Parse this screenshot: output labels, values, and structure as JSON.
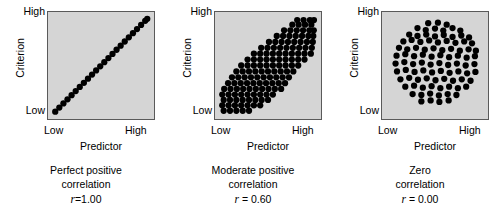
{
  "figure": {
    "background": "#ffffff",
    "plot_background": "#d5d5d5",
    "plot_border": "#5a5a5a",
    "dot_color": "#000000"
  },
  "axes": {
    "x_label": "Predictor",
    "y_label": "Criterion",
    "x_tick_low": "Low",
    "x_tick_high": "High",
    "y_tick_low": "Low",
    "y_tick_high": "High"
  },
  "panels": [
    {
      "id": "perfect-positive",
      "caption_line1": "Perfect positive",
      "caption_line2": "correlation",
      "r_symbol": "r",
      "r_value": "=1.00"
    },
    {
      "id": "moderate-positive",
      "caption_line1": "Moderate positive",
      "caption_line2": "correlation",
      "r_symbol": "r",
      "r_value": "= 0.60"
    },
    {
      "id": "zero",
      "caption_line1": "Zero",
      "caption_line2": "correlation",
      "r_symbol": "r",
      "r_value": "= 0.00"
    }
  ],
  "chart_data": {
    "type": "scatter",
    "title": "",
    "xlabel": "Predictor",
    "ylabel": "Criterion",
    "xlim": [
      0,
      1
    ],
    "ylim": [
      0,
      1
    ],
    "xticks": [
      "Low",
      "High"
    ],
    "yticks": [
      "Low",
      "High"
    ],
    "grid": false,
    "legend": "none",
    "marker": "filled-circle",
    "marker_radius_px": 3.2,
    "series": [
      {
        "name": "Perfect positive correlation",
        "r": 1.0,
        "n": 24,
        "points": [
          [
            0.03,
            0.03
          ],
          [
            0.072,
            0.072
          ],
          [
            0.114,
            0.114
          ],
          [
            0.156,
            0.156
          ],
          [
            0.198,
            0.198
          ],
          [
            0.24,
            0.24
          ],
          [
            0.282,
            0.282
          ],
          [
            0.324,
            0.324
          ],
          [
            0.366,
            0.366
          ],
          [
            0.408,
            0.408
          ],
          [
            0.45,
            0.45
          ],
          [
            0.492,
            0.492
          ],
          [
            0.534,
            0.534
          ],
          [
            0.576,
            0.576
          ],
          [
            0.618,
            0.618
          ],
          [
            0.66,
            0.66
          ],
          [
            0.702,
            0.702
          ],
          [
            0.744,
            0.744
          ],
          [
            0.786,
            0.786
          ],
          [
            0.828,
            0.828
          ],
          [
            0.87,
            0.87
          ],
          [
            0.912,
            0.912
          ],
          [
            0.954,
            0.954
          ],
          [
            0.975,
            0.975
          ]
        ]
      },
      {
        "name": "Moderate positive correlation",
        "r": 0.6,
        "n": 118,
        "points": [
          [
            0.045,
            0.04
          ],
          [
            0.11,
            0.04
          ],
          [
            0.175,
            0.04
          ],
          [
            0.24,
            0.04
          ],
          [
            0.305,
            0.04
          ],
          [
            0.03,
            0.095
          ],
          [
            0.095,
            0.095
          ],
          [
            0.16,
            0.095
          ],
          [
            0.225,
            0.095
          ],
          [
            0.29,
            0.095
          ],
          [
            0.355,
            0.095
          ],
          [
            0.42,
            0.095
          ],
          [
            0.045,
            0.15
          ],
          [
            0.11,
            0.15
          ],
          [
            0.175,
            0.15
          ],
          [
            0.24,
            0.15
          ],
          [
            0.305,
            0.15
          ],
          [
            0.37,
            0.15
          ],
          [
            0.435,
            0.15
          ],
          [
            0.5,
            0.15
          ],
          [
            0.03,
            0.205
          ],
          [
            0.095,
            0.205
          ],
          [
            0.16,
            0.205
          ],
          [
            0.225,
            0.205
          ],
          [
            0.29,
            0.205
          ],
          [
            0.355,
            0.205
          ],
          [
            0.42,
            0.205
          ],
          [
            0.485,
            0.205
          ],
          [
            0.55,
            0.205
          ],
          [
            0.05,
            0.262
          ],
          [
            0.115,
            0.262
          ],
          [
            0.18,
            0.262
          ],
          [
            0.245,
            0.262
          ],
          [
            0.31,
            0.262
          ],
          [
            0.375,
            0.262
          ],
          [
            0.44,
            0.262
          ],
          [
            0.505,
            0.262
          ],
          [
            0.57,
            0.262
          ],
          [
            0.635,
            0.262
          ],
          [
            0.09,
            0.32
          ],
          [
            0.155,
            0.32
          ],
          [
            0.22,
            0.32
          ],
          [
            0.285,
            0.32
          ],
          [
            0.35,
            0.32
          ],
          [
            0.415,
            0.32
          ],
          [
            0.48,
            0.32
          ],
          [
            0.545,
            0.32
          ],
          [
            0.61,
            0.32
          ],
          [
            0.675,
            0.32
          ],
          [
            0.13,
            0.38
          ],
          [
            0.195,
            0.38
          ],
          [
            0.26,
            0.38
          ],
          [
            0.325,
            0.38
          ],
          [
            0.39,
            0.38
          ],
          [
            0.455,
            0.38
          ],
          [
            0.52,
            0.38
          ],
          [
            0.585,
            0.38
          ],
          [
            0.65,
            0.38
          ],
          [
            0.715,
            0.38
          ],
          [
            0.175,
            0.44
          ],
          [
            0.24,
            0.44
          ],
          [
            0.305,
            0.44
          ],
          [
            0.37,
            0.44
          ],
          [
            0.435,
            0.44
          ],
          [
            0.5,
            0.44
          ],
          [
            0.565,
            0.44
          ],
          [
            0.63,
            0.44
          ],
          [
            0.695,
            0.44
          ],
          [
            0.76,
            0.44
          ],
          [
            0.225,
            0.5
          ],
          [
            0.29,
            0.5
          ],
          [
            0.355,
            0.5
          ],
          [
            0.42,
            0.5
          ],
          [
            0.485,
            0.5
          ],
          [
            0.55,
            0.5
          ],
          [
            0.615,
            0.5
          ],
          [
            0.68,
            0.5
          ],
          [
            0.745,
            0.5
          ],
          [
            0.81,
            0.5
          ],
          [
            0.29,
            0.56
          ],
          [
            0.355,
            0.56
          ],
          [
            0.42,
            0.56
          ],
          [
            0.485,
            0.56
          ],
          [
            0.55,
            0.56
          ],
          [
            0.615,
            0.56
          ],
          [
            0.68,
            0.56
          ],
          [
            0.745,
            0.56
          ],
          [
            0.81,
            0.56
          ],
          [
            0.875,
            0.56
          ],
          [
            0.355,
            0.62
          ],
          [
            0.42,
            0.62
          ],
          [
            0.485,
            0.62
          ],
          [
            0.55,
            0.62
          ],
          [
            0.615,
            0.62
          ],
          [
            0.68,
            0.62
          ],
          [
            0.745,
            0.62
          ],
          [
            0.81,
            0.62
          ],
          [
            0.875,
            0.62
          ],
          [
            0.94,
            0.62
          ],
          [
            0.43,
            0.68
          ],
          [
            0.495,
            0.68
          ],
          [
            0.56,
            0.68
          ],
          [
            0.625,
            0.68
          ],
          [
            0.69,
            0.68
          ],
          [
            0.755,
            0.68
          ],
          [
            0.82,
            0.68
          ],
          [
            0.885,
            0.68
          ],
          [
            0.95,
            0.68
          ],
          [
            0.51,
            0.74
          ],
          [
            0.575,
            0.74
          ],
          [
            0.64,
            0.74
          ],
          [
            0.705,
            0.74
          ],
          [
            0.77,
            0.74
          ],
          [
            0.835,
            0.74
          ],
          [
            0.9,
            0.74
          ],
          [
            0.96,
            0.74
          ],
          [
            0.59,
            0.8
          ],
          [
            0.655,
            0.8
          ],
          [
            0.72,
            0.8
          ],
          [
            0.785,
            0.8
          ],
          [
            0.85,
            0.8
          ],
          [
            0.915,
            0.8
          ],
          [
            0.965,
            0.8
          ],
          [
            0.665,
            0.858
          ],
          [
            0.73,
            0.858
          ],
          [
            0.795,
            0.858
          ],
          [
            0.86,
            0.858
          ],
          [
            0.925,
            0.858
          ],
          [
            0.97,
            0.858
          ],
          [
            0.75,
            0.915
          ],
          [
            0.815,
            0.915
          ],
          [
            0.88,
            0.915
          ],
          [
            0.945,
            0.915
          ],
          [
            0.8,
            0.962
          ],
          [
            0.865,
            0.962
          ],
          [
            0.93,
            0.962
          ],
          [
            0.972,
            0.962
          ]
        ]
      },
      {
        "name": "Zero correlation",
        "r": 0.0,
        "n": 92,
        "points": [
          [
            0.43,
            0.93
          ],
          [
            0.53,
            0.935
          ],
          [
            0.62,
            0.915
          ],
          [
            0.32,
            0.88
          ],
          [
            0.405,
            0.86
          ],
          [
            0.5,
            0.875
          ],
          [
            0.585,
            0.855
          ],
          [
            0.68,
            0.88
          ],
          [
            0.76,
            0.855
          ],
          [
            0.235,
            0.815
          ],
          [
            0.32,
            0.8
          ],
          [
            0.41,
            0.815
          ],
          [
            0.5,
            0.795
          ],
          [
            0.59,
            0.81
          ],
          [
            0.68,
            0.79
          ],
          [
            0.77,
            0.805
          ],
          [
            0.85,
            0.785
          ],
          [
            0.175,
            0.745
          ],
          [
            0.26,
            0.76
          ],
          [
            0.35,
            0.74
          ],
          [
            0.44,
            0.755
          ],
          [
            0.53,
            0.735
          ],
          [
            0.62,
            0.75
          ],
          [
            0.71,
            0.73
          ],
          [
            0.8,
            0.745
          ],
          [
            0.88,
            0.725
          ],
          [
            0.13,
            0.68
          ],
          [
            0.215,
            0.665
          ],
          [
            0.305,
            0.68
          ],
          [
            0.395,
            0.66
          ],
          [
            0.485,
            0.675
          ],
          [
            0.575,
            0.655
          ],
          [
            0.665,
            0.67
          ],
          [
            0.755,
            0.65
          ],
          [
            0.845,
            0.665
          ],
          [
            0.92,
            0.65
          ],
          [
            0.105,
            0.6
          ],
          [
            0.195,
            0.615
          ],
          [
            0.285,
            0.595
          ],
          [
            0.375,
            0.61
          ],
          [
            0.465,
            0.59
          ],
          [
            0.555,
            0.605
          ],
          [
            0.645,
            0.585
          ],
          [
            0.735,
            0.6
          ],
          [
            0.825,
            0.58
          ],
          [
            0.91,
            0.595
          ],
          [
            0.095,
            0.52
          ],
          [
            0.185,
            0.535
          ],
          [
            0.275,
            0.515
          ],
          [
            0.365,
            0.53
          ],
          [
            0.455,
            0.51
          ],
          [
            0.545,
            0.525
          ],
          [
            0.635,
            0.505
          ],
          [
            0.725,
            0.52
          ],
          [
            0.815,
            0.5
          ],
          [
            0.905,
            0.515
          ],
          [
            0.11,
            0.44
          ],
          [
            0.2,
            0.455
          ],
          [
            0.29,
            0.435
          ],
          [
            0.38,
            0.45
          ],
          [
            0.47,
            0.43
          ],
          [
            0.56,
            0.445
          ],
          [
            0.65,
            0.425
          ],
          [
            0.74,
            0.44
          ],
          [
            0.83,
            0.42
          ],
          [
            0.915,
            0.435
          ],
          [
            0.145,
            0.36
          ],
          [
            0.235,
            0.375
          ],
          [
            0.325,
            0.355
          ],
          [
            0.415,
            0.37
          ],
          [
            0.505,
            0.35
          ],
          [
            0.595,
            0.365
          ],
          [
            0.685,
            0.345
          ],
          [
            0.775,
            0.36
          ],
          [
            0.865,
            0.345
          ],
          [
            0.195,
            0.285
          ],
          [
            0.285,
            0.295
          ],
          [
            0.375,
            0.275
          ],
          [
            0.465,
            0.29
          ],
          [
            0.555,
            0.27
          ],
          [
            0.645,
            0.285
          ],
          [
            0.735,
            0.27
          ],
          [
            0.82,
            0.285
          ],
          [
            0.27,
            0.21
          ],
          [
            0.36,
            0.2
          ],
          [
            0.45,
            0.215
          ],
          [
            0.54,
            0.195
          ],
          [
            0.63,
            0.21
          ],
          [
            0.72,
            0.2
          ],
          [
            0.36,
            0.135
          ],
          [
            0.455,
            0.145
          ],
          [
            0.545,
            0.13
          ],
          [
            0.64,
            0.145
          ]
        ]
      }
    ]
  }
}
